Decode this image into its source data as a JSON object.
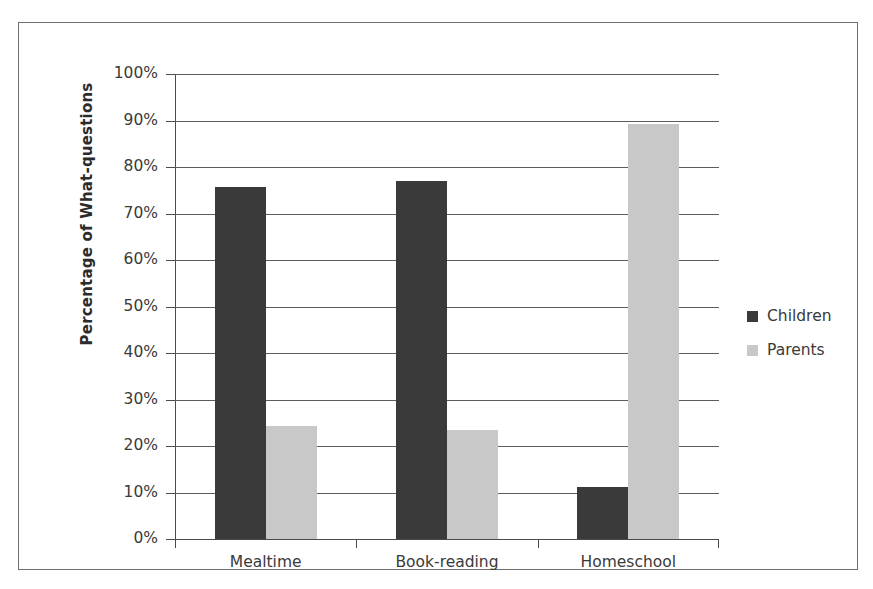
{
  "chart_data": {
    "type": "bar",
    "title": "",
    "subtitle": "",
    "xlabel": "",
    "ylabel": "Percentage of What-questions",
    "categories": [
      "Mealtime",
      "Book-reading",
      "Homeschool"
    ],
    "series": [
      {
        "name": "Children",
        "color": "#3a3a3a",
        "values": [
          75.6,
          77.0,
          11.1
        ]
      },
      {
        "name": "Parents",
        "color": "#c8c8c8",
        "values": [
          24.3,
          23.4,
          89.3
        ]
      }
    ],
    "ylim": [
      0,
      100
    ],
    "ytick_values": [
      0,
      10,
      20,
      30,
      40,
      50,
      60,
      70,
      80,
      90,
      100
    ],
    "ytick_labels": [
      "0%",
      "10%",
      "20%",
      "30%",
      "40%",
      "50%",
      "60%",
      "70%",
      "80%",
      "90%",
      "100%"
    ],
    "grid": true,
    "grid_axis": "y",
    "legend_position": "right",
    "legend_entries": [
      "Children",
      "Parents"
    ],
    "value_suffix": "%"
  },
  "figure": {
    "border_color": "#6e6e6e",
    "background": "#ffffff",
    "axis_color": "#4a4a4a",
    "gridline_color": "#5d5d5d",
    "text_color": "#3a3a3a"
  }
}
